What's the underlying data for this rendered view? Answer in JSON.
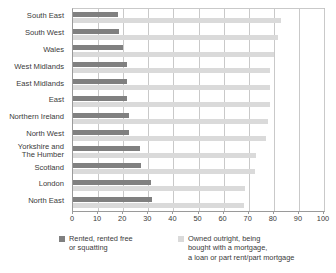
{
  "chart_data": {
    "type": "bar",
    "orientation": "horizontal",
    "title": "",
    "subtitle": "",
    "xlabel": "",
    "ylabel": "",
    "xlim": [
      0,
      100
    ],
    "xticks": [
      0,
      10,
      20,
      30,
      40,
      50,
      60,
      70,
      80,
      90,
      100
    ],
    "xtick_labels": [
      "0",
      "10",
      "20",
      "30",
      "40",
      "50",
      "60",
      "70",
      "80",
      "90",
      "100"
    ],
    "grid": "vertical",
    "legend_position": "bottom",
    "categories": [
      "South East",
      "South West",
      "Wales",
      "West Midlands",
      "East Midlands",
      "East",
      "Northern Ireland",
      "North West",
      "Yorkshire and\nThe Humber",
      "Scotland",
      "London",
      "North East"
    ],
    "series": [
      {
        "name": "Rented, rented free\nor squatting",
        "color": "#808080",
        "values": [
          18.0,
          18.5,
          20.0,
          21.5,
          21.5,
          21.5,
          22.5,
          22.5,
          26.5,
          27.0,
          31.0,
          31.5
        ]
      },
      {
        "name": "Owned outright, being\nbought with a mortgage,\na loan or part rent/part mortgage",
        "color": "#dadada",
        "values": [
          83.0,
          81.5,
          80.0,
          78.5,
          78.5,
          78.5,
          77.5,
          77.0,
          73.0,
          72.5,
          68.5,
          68.0
        ]
      }
    ]
  },
  "legend": {
    "entries": [
      {
        "label": "Rented, rented free\nor squatting",
        "color": "#808080"
      },
      {
        "label": "Owned outright, being\nbought with a mortgage,\na loan or part rent/part mortgage",
        "color": "#dadada"
      }
    ]
  },
  "colors": {
    "rented": "#808080",
    "owned": "#dadada",
    "axis": "#9a9a9a",
    "grid": "#c9c9c9",
    "text": "#3a3a3a",
    "background": "#ffffff"
  }
}
